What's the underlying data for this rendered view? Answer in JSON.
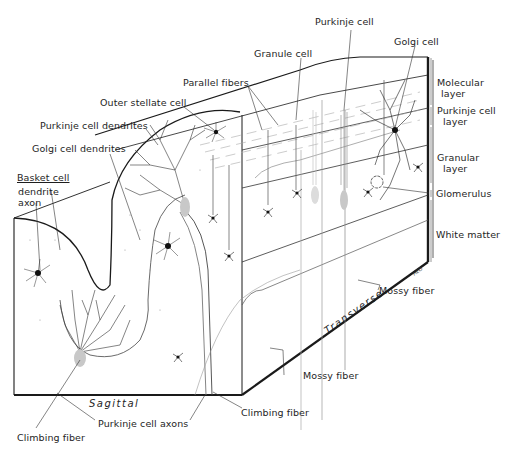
{
  "figure": {
    "planes": {
      "sagittal": "Sagittal",
      "transverse": "Transverse"
    },
    "signature": "HEO"
  },
  "labels": {
    "purkinje_cell": "Purkinje cell",
    "golgi_cell": "Golgi cell",
    "granule_cell": "Granule cell",
    "parallel_fibers": "Parallel fibers",
    "outer_stellate_cell": "Outer stellate cell",
    "purkinje_cell_dendrites": "Purkinje cell dendrites",
    "golgi_cell_dendrites": "Golgi cell dendrites",
    "basket_cell": "Basket cell",
    "basket_dendrite": "dendrite",
    "basket_axon": "axon",
    "climbing_fiber_left": "Climbing fiber",
    "purkinje_cell_axons": "Purkinje cell axons",
    "climbing_fiber_center": "Climbing fiber",
    "mossy_fiber_bottom": "Mossy fiber",
    "mossy_fiber_right": "Mossy fiber"
  },
  "layers": [
    {
      "line1": "Molecular",
      "line2": "layer"
    },
    {
      "line1": "Purkinje  cell",
      "line2": "layer"
    },
    {
      "line1": "Granular",
      "line2": "layer"
    },
    {
      "line1": "Glomerulus",
      "line2": ""
    },
    {
      "line1": "White matter",
      "line2": ""
    }
  ],
  "colors": {
    "ink": "#1a1a1a",
    "fiber": "#8a8a8a",
    "shade": "#c8c8c8",
    "background": "#ffffff"
  }
}
